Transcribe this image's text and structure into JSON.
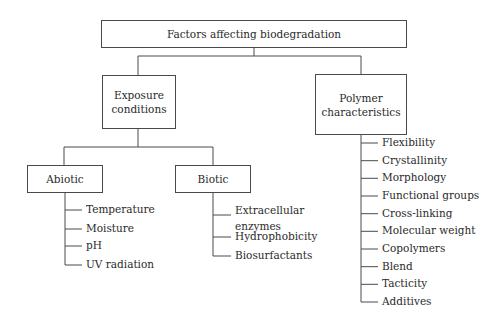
{
  "diagram": {
    "type": "tree",
    "root": {
      "label": "Factors affecting biodegradation"
    },
    "branches": [
      {
        "label": "Exposure conditions",
        "label_lines": [
          "Exposure",
          "conditions"
        ],
        "children": [
          {
            "label": "Abiotic",
            "items": [
              "Temperature",
              "Moisture",
              "pH",
              "UV radiation"
            ]
          },
          {
            "label": "Biotic",
            "items": [
              "Extracellular enzymes",
              "Hydrophobicity",
              "Biosurfactants"
            ],
            "item_lines": [
              [
                "Extracellular",
                "enzymes"
              ]
            ]
          }
        ]
      },
      {
        "label": "Polymer characteristics",
        "label_lines": [
          "Polymer",
          "characteristics"
        ],
        "items": [
          "Flexibility",
          "Crystallinity",
          "Morphology",
          "Functional groups",
          "Cross-linking",
          "Molecular weight",
          "Copolymers",
          "Blend",
          "Tacticity",
          "Additives"
        ]
      }
    ],
    "colors": {
      "line": "#4a4a4a",
      "text": "#2a2a2a",
      "background": "#ffffff"
    }
  }
}
